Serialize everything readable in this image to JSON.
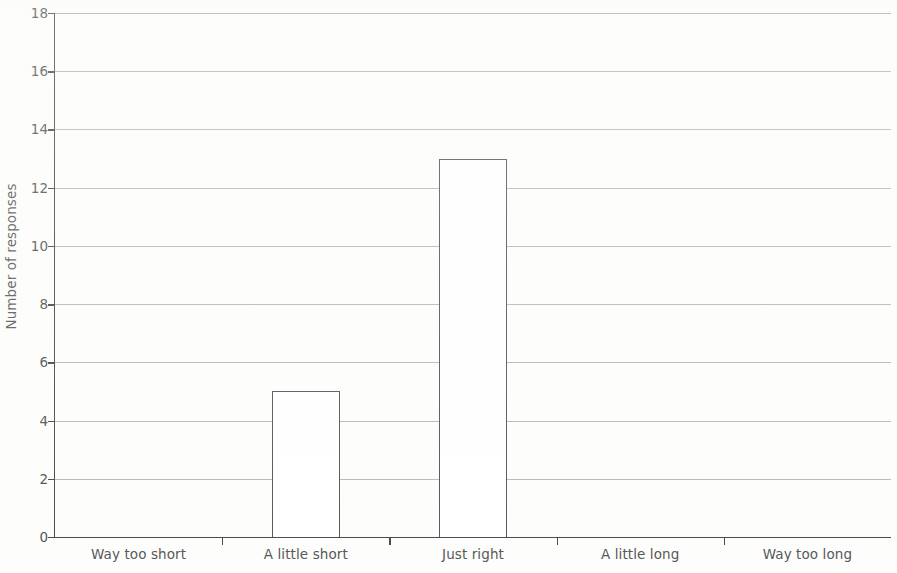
{
  "chart_data": {
    "type": "bar",
    "title": "",
    "xlabel": "",
    "ylabel": "Number of responses",
    "categories": [
      "Way too short",
      "A little short",
      "Just right",
      "A little long",
      "Way too long"
    ],
    "values": [
      0,
      5,
      13,
      0,
      0
    ],
    "ylim": [
      0,
      18
    ],
    "y_ticks": [
      0,
      2,
      4,
      6,
      8,
      10,
      12,
      14,
      16,
      18
    ],
    "y_tick_labels": [
      "0",
      "2",
      "4",
      "6",
      "8",
      "10",
      "12",
      "14",
      "16",
      "18"
    ],
    "grid": true,
    "grid_axis": "y",
    "legend": null,
    "legend_position": "none",
    "bar_fill_color": "#ffffff",
    "bar_border_color": "#575757",
    "gridline_color": "#b9b9b9",
    "axis_color": "#4a4a4a",
    "text_color": "#575757",
    "background_color": "#fdfdfc",
    "series": [
      {
        "name": "Number of responses",
        "values": [
          0,
          5,
          13,
          0,
          0
        ]
      }
    ],
    "annotations": []
  }
}
